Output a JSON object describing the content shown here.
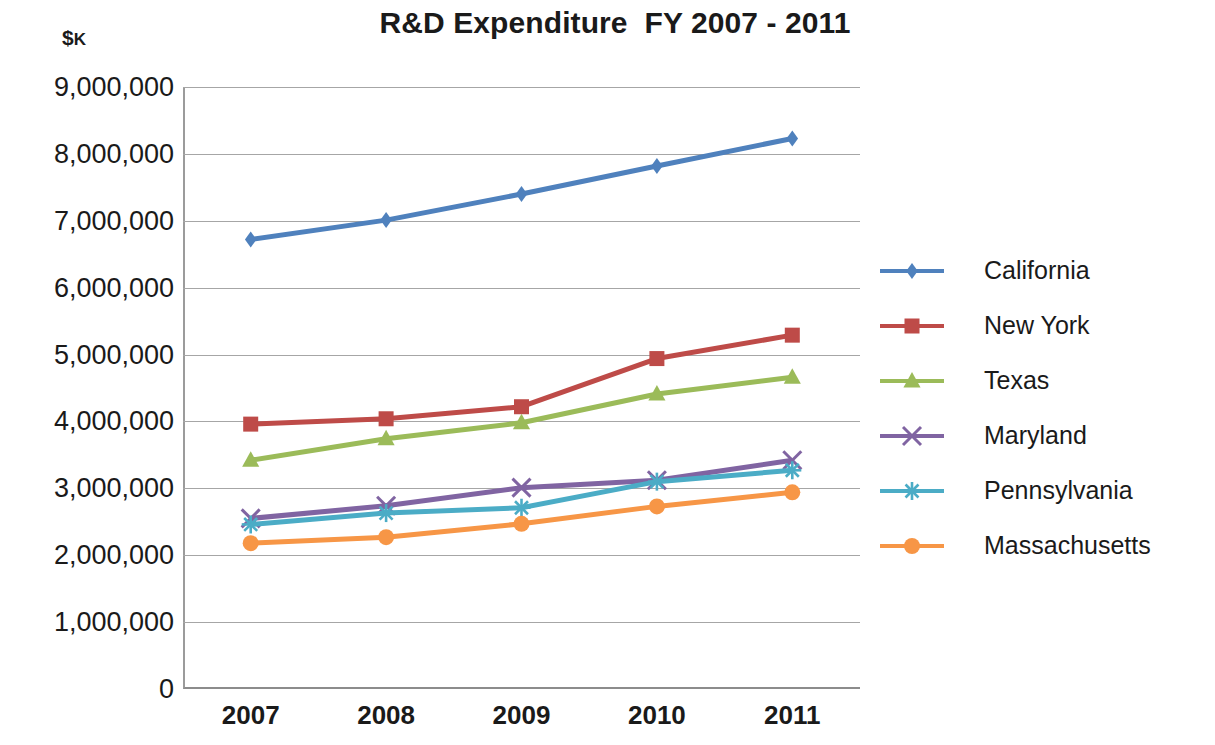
{
  "chart_data": {
    "type": "line",
    "title": "R&D Expenditure  FY 2007 - 2011",
    "xlabel": "",
    "ylabel": "$K",
    "categories": [
      "2007",
      "2008",
      "2009",
      "2010",
      "2011"
    ],
    "ylim": [
      0,
      9000000
    ],
    "ytick_step": 1000000,
    "ytick_labels": [
      "9,000,000",
      "8,000,000",
      "7,000,000",
      "6,000,000",
      "5,000,000",
      "4,000,000",
      "3,000,000",
      "2,000,000",
      "1,000,000",
      "0"
    ],
    "ytick_values": [
      9000000,
      8000000,
      7000000,
      6000000,
      5000000,
      4000000,
      3000000,
      2000000,
      1000000,
      0
    ],
    "grid": true,
    "legend_position": "right",
    "series": [
      {
        "name": "California",
        "color": "#4f81bd",
        "marker": "diamond",
        "values": [
          6720000,
          7010000,
          7400000,
          7820000,
          8230000
        ]
      },
      {
        "name": "New York",
        "color": "#be4b48",
        "marker": "square",
        "values": [
          3960000,
          4040000,
          4220000,
          4940000,
          5290000
        ]
      },
      {
        "name": "Texas",
        "color": "#9bbb59",
        "marker": "triangle",
        "values": [
          3420000,
          3740000,
          3980000,
          4410000,
          4660000
        ]
      },
      {
        "name": "Maryland",
        "color": "#8064a2",
        "marker": "x",
        "values": [
          2550000,
          2740000,
          3010000,
          3120000,
          3420000
        ]
      },
      {
        "name": "Pennsylvania",
        "color": "#4bacc6",
        "marker": "asterisk",
        "values": [
          2460000,
          2630000,
          2710000,
          3100000,
          3270000
        ]
      },
      {
        "name": "Massachusetts",
        "color": "#f79646",
        "marker": "circle",
        "values": [
          2180000,
          2270000,
          2470000,
          2730000,
          2940000
        ]
      }
    ]
  },
  "axis": {
    "unit_prefix": "$",
    "unit_suffix": "K"
  }
}
